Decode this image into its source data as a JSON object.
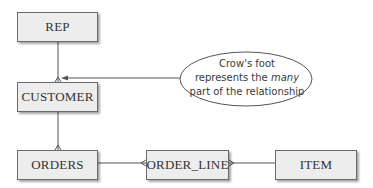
{
  "diagram": {
    "type": "entity-relationship",
    "notation": "crow's foot",
    "entities": [
      {
        "id": "rep",
        "label": "REP"
      },
      {
        "id": "customer",
        "label": "CUSTOMER"
      },
      {
        "id": "orders",
        "label": "ORDERS"
      },
      {
        "id": "order_line",
        "label": "ORDER_LINE"
      },
      {
        "id": "item",
        "label": "ITEM"
      }
    ],
    "relationships": [
      {
        "from": "REP",
        "to": "CUSTOMER",
        "many_side": "CUSTOMER"
      },
      {
        "from": "CUSTOMER",
        "to": "ORDERS",
        "many_side": "ORDERS"
      },
      {
        "from": "ORDERS",
        "to": "ORDER_LINE",
        "many_side": "ORDER_LINE"
      },
      {
        "from": "ITEM",
        "to": "ORDER_LINE",
        "many_side": "ORDER_LINE"
      }
    ],
    "callout": {
      "line1": "Crow's foot",
      "line2_prefix": "represents the ",
      "line2_emphasis": "many",
      "line3": "part of the relationship",
      "points_to": "crow's foot at CUSTOMER"
    }
  },
  "colors": {
    "entity_fill": "#ededed",
    "entity_border": "#6a6a6a",
    "line": "#555555",
    "text": "#333333"
  }
}
